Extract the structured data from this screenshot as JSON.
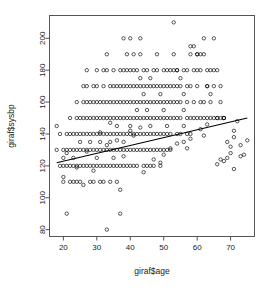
{
  "chart_data": {
    "type": "scatter",
    "title": "",
    "xlabel": "giraf$age",
    "ylabel": "giraf$sysbp",
    "xlim": [
      16,
      77
    ],
    "ylim": [
      76,
      214
    ],
    "xticks": [
      20,
      30,
      40,
      50,
      60,
      70
    ],
    "yticks": [
      80,
      100,
      120,
      140,
      160,
      180,
      200
    ],
    "grid": false,
    "legend": null,
    "point_marker": "open-circle",
    "point_color": "#000000",
    "regression_line": {
      "color": "#000000",
      "x_start": 18,
      "y_start": 122,
      "x_end": 75,
      "y_end": 150
    },
    "x": [
      18,
      18,
      19,
      19,
      20,
      20,
      20,
      20,
      21,
      21,
      21,
      21,
      22,
      22,
      22,
      22,
      22,
      23,
      23,
      23,
      23,
      23,
      24,
      24,
      24,
      24,
      24,
      24,
      25,
      25,
      25,
      25,
      25,
      25,
      26,
      26,
      26,
      26,
      26,
      26,
      27,
      27,
      27,
      27,
      27,
      27,
      27,
      28,
      28,
      28,
      28,
      28,
      28,
      28,
      29,
      29,
      29,
      29,
      29,
      29,
      29,
      30,
      30,
      30,
      30,
      30,
      30,
      30,
      30,
      31,
      31,
      31,
      31,
      31,
      31,
      31,
      32,
      32,
      32,
      32,
      32,
      32,
      32,
      32,
      33,
      33,
      33,
      33,
      33,
      33,
      33,
      33,
      34,
      34,
      34,
      34,
      34,
      34,
      34,
      34,
      35,
      35,
      35,
      35,
      35,
      35,
      35,
      35,
      36,
      36,
      36,
      36,
      36,
      36,
      36,
      36,
      37,
      37,
      37,
      37,
      37,
      37,
      37,
      37,
      38,
      38,
      38,
      38,
      38,
      38,
      38,
      38,
      38,
      39,
      39,
      39,
      39,
      39,
      39,
      39,
      39,
      40,
      40,
      40,
      40,
      40,
      40,
      40,
      40,
      40,
      41,
      41,
      41,
      41,
      41,
      41,
      41,
      41,
      42,
      42,
      42,
      42,
      42,
      42,
      42,
      42,
      43,
      43,
      43,
      43,
      43,
      43,
      43,
      43,
      44,
      44,
      44,
      44,
      44,
      44,
      44,
      44,
      45,
      45,
      45,
      45,
      45,
      45,
      45,
      45,
      46,
      46,
      46,
      46,
      46,
      46,
      46,
      46,
      47,
      47,
      47,
      47,
      47,
      47,
      47,
      48,
      48,
      48,
      48,
      48,
      48,
      48,
      49,
      49,
      49,
      49,
      49,
      49,
      49,
      50,
      50,
      50,
      50,
      50,
      50,
      50,
      51,
      51,
      51,
      51,
      51,
      51,
      51,
      52,
      52,
      52,
      52,
      52,
      52,
      53,
      53,
      53,
      53,
      53,
      53,
      54,
      54,
      54,
      54,
      54,
      54,
      55,
      55,
      55,
      55,
      55,
      56,
      56,
      56,
      56,
      56,
      57,
      57,
      57,
      57,
      57,
      58,
      58,
      58,
      58,
      58,
      59,
      59,
      59,
      59,
      60,
      60,
      60,
      60,
      60,
      61,
      61,
      61,
      61,
      62,
      62,
      62,
      62,
      63,
      63,
      63,
      63,
      64,
      64,
      64,
      64,
      65,
      65,
      65,
      65,
      66,
      66,
      66,
      67,
      67,
      67,
      68,
      68,
      68,
      69,
      69,
      70,
      70,
      71,
      71,
      72,
      73,
      74,
      75,
      27,
      31,
      34,
      38,
      41,
      43,
      47,
      49,
      52,
      54,
      58,
      61,
      63,
      66,
      68,
      71,
      73,
      33,
      21,
      36,
      40,
      24,
      29,
      44,
      50,
      57,
      62,
      67,
      20,
      26,
      37,
      45,
      53,
      60,
      64,
      70,
      74
    ],
    "y": [
      145,
      130,
      140,
      120,
      130,
      125,
      120,
      110,
      140,
      130,
      120,
      90,
      150,
      140,
      130,
      120,
      110,
      140,
      130,
      125,
      120,
      110,
      160,
      150,
      140,
      130,
      120,
      110,
      150,
      140,
      135,
      130,
      120,
      110,
      170,
      160,
      150,
      140,
      130,
      120,
      180,
      170,
      160,
      150,
      140,
      130,
      120,
      160,
      150,
      140,
      135,
      130,
      120,
      110,
      170,
      160,
      150,
      140,
      130,
      120,
      110,
      180,
      170,
      160,
      150,
      140,
      130,
      125,
      120,
      160,
      150,
      140,
      135,
      130,
      120,
      110,
      180,
      170,
      160,
      150,
      140,
      130,
      120,
      110,
      190,
      180,
      160,
      150,
      140,
      130,
      120,
      80,
      170,
      160,
      150,
      140,
      135,
      130,
      120,
      110,
      180,
      170,
      160,
      150,
      140,
      130,
      125,
      120,
      170,
      160,
      150,
      145,
      140,
      130,
      120,
      110,
      180,
      170,
      160,
      150,
      140,
      130,
      120,
      90,
      200,
      180,
      170,
      160,
      150,
      140,
      135,
      130,
      120,
      190,
      180,
      170,
      160,
      150,
      140,
      130,
      120,
      200,
      180,
      170,
      160,
      150,
      145,
      140,
      130,
      120,
      190,
      180,
      170,
      160,
      150,
      140,
      130,
      120,
      180,
      170,
      160,
      155,
      150,
      140,
      130,
      120,
      200,
      190,
      175,
      170,
      160,
      150,
      140,
      130,
      180,
      170,
      165,
      160,
      150,
      140,
      130,
      120,
      180,
      170,
      160,
      155,
      150,
      140,
      130,
      120,
      175,
      170,
      160,
      150,
      145,
      140,
      130,
      120,
      180,
      170,
      160,
      150,
      140,
      130,
      120,
      190,
      180,
      170,
      160,
      150,
      140,
      130,
      170,
      165,
      160,
      150,
      140,
      130,
      120,
      180,
      170,
      160,
      155,
      150,
      140,
      130,
      180,
      170,
      160,
      150,
      145,
      140,
      130,
      180,
      170,
      160,
      150,
      140,
      130,
      210,
      190,
      180,
      170,
      160,
      150,
      180,
      170,
      160,
      150,
      140,
      180,
      170,
      160,
      150,
      140,
      175,
      165,
      155,
      145,
      135,
      180,
      170,
      160,
      150,
      140,
      180,
      170,
      150,
      140,
      195,
      190,
      180,
      160,
      150,
      195,
      190,
      170,
      150,
      190,
      180,
      160,
      150,
      190,
      180,
      160,
      150,
      200,
      190,
      170,
      150,
      180,
      170,
      160,
      180,
      165,
      150,
      200,
      180,
      150,
      170,
      150,
      180,
      150,
      170,
      150,
      160,
      150,
      150,
      150,
      135,
      125,
      128,
      132,
      138,
      142,
      148,
      133,
      127,
      136,
      129,
      141,
      147,
      126,
      139,
      144,
      124,
      122,
      131,
      134,
      137,
      143,
      146,
      121,
      123,
      118,
      126,
      133,
      128,
      136,
      142,
      119,
      117,
      116,
      127,
      131,
      139,
      124,
      113,
      108,
      105
    ]
  },
  "axis": {
    "x_tick_labels": [
      "20",
      "30",
      "40",
      "50",
      "60",
      "70"
    ],
    "y_tick_labels": [
      "80",
      "100",
      "120",
      "140",
      "160",
      "180",
      "200"
    ]
  }
}
